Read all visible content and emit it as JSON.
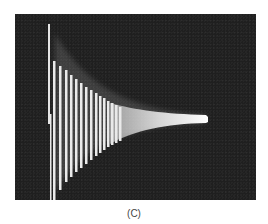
{
  "figure": {
    "caption": "(C)",
    "colors": {
      "background": "#1f1f1f",
      "trace": "#f2f2f2",
      "page": "#ffffff"
    }
  }
}
